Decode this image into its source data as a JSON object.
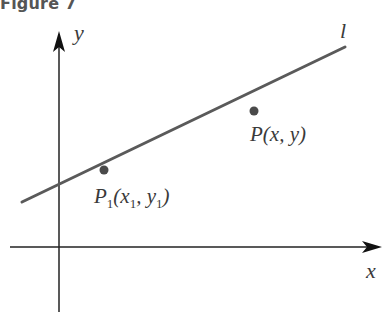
{
  "figure": {
    "title": "Figure 7",
    "axes": {
      "x_label": "x",
      "y_label": "y"
    },
    "line": {
      "label": "l",
      "color": "#5a5a5a"
    },
    "points": [
      {
        "name": "P1",
        "label_main": "P",
        "label_sub": "1",
        "label_rest": "(x",
        "label_sub2": "1",
        "label_mid": ", y",
        "label_sub3": "1",
        "label_end": ")"
      },
      {
        "name": "P",
        "label": "P(x, y)"
      }
    ],
    "colors": {
      "axis": "#222222",
      "line": "#5a5a5a",
      "point": "#4a4a4a",
      "text": "#3a3a3a"
    }
  }
}
